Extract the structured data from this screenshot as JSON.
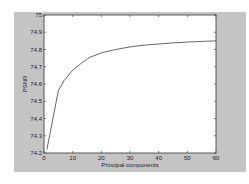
{
  "chart_data": {
    "type": "line",
    "title": "",
    "xlabel": "Principal components",
    "ylabel": "PSNR",
    "xlim": [
      0,
      60
    ],
    "ylim": [
      74.2,
      75
    ],
    "xticks": [
      "0",
      "10",
      "20",
      "30",
      "40",
      "50",
      "60"
    ],
    "yticks": [
      "74.2",
      "74.3",
      "74.4",
      "74.5",
      "74.6",
      "74.7",
      "74.8",
      "74.9",
      "75"
    ],
    "grid": false,
    "series": [
      {
        "name": "PSNR",
        "x": [
          1,
          3,
          5,
          7,
          10,
          13,
          16,
          20,
          25,
          30,
          35,
          40,
          45,
          50,
          55,
          60
        ],
        "y": [
          74.22,
          74.39,
          74.56,
          74.62,
          74.68,
          74.72,
          74.755,
          74.78,
          74.8,
          74.815,
          74.825,
          74.832,
          74.838,
          74.843,
          74.847,
          74.85
        ]
      }
    ],
    "line_color": "#555555",
    "figure_bg": "#c4c4c4",
    "axes_bg": "#ffffff"
  }
}
